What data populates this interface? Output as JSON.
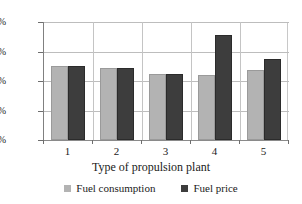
{
  "chart_data": {
    "type": "bar",
    "title": "",
    "xlabel": "Type of propulsion plant",
    "ylabel": "",
    "categories": [
      "1",
      "2",
      "3",
      "4",
      "5"
    ],
    "series": [
      {
        "name": "Fuel consumption",
        "color": "#b3b3b3",
        "values": [
          100,
          97,
          90,
          88,
          95
        ]
      },
      {
        "name": "Fuel price",
        "color": "#3d3d3d",
        "values": [
          100,
          97,
          90,
          143,
          110
        ]
      }
    ],
    "ylim": [
      0,
      160
    ],
    "ytick_values": [
      0,
      40,
      80,
      120,
      160
    ],
    "ytick_labels": [
      "0%",
      "40%",
      "80%",
      "120%",
      "160%"
    ],
    "grid": true,
    "legend_position": "bottom",
    "value_suffix": "%"
  },
  "legend": {
    "entries": [
      {
        "label": "Fuel consumption"
      },
      {
        "label": "Fuel price"
      }
    ]
  }
}
